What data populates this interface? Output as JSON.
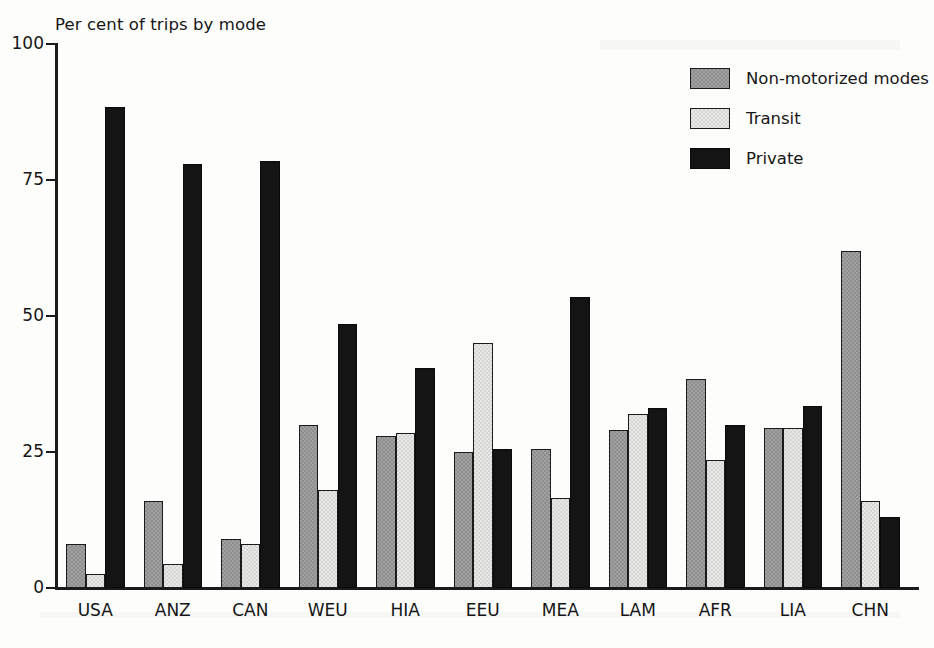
{
  "chart_data": {
    "type": "bar",
    "title": "Per cent of trips by mode",
    "xlabel": "",
    "ylabel": "",
    "ylim": [
      0,
      100
    ],
    "yticks": [
      0,
      25,
      50,
      75,
      100
    ],
    "grid": false,
    "legend_position": "top-right",
    "categories": [
      "USA",
      "ANZ",
      "CAN",
      "WEU",
      "HIA",
      "EEU",
      "MEA",
      "LAM",
      "AFR",
      "LIA",
      "CHN"
    ],
    "series": [
      {
        "name": "Non-motorized modes",
        "color": "#8e8e8e",
        "values": [
          8,
          16,
          9,
          30,
          28,
          25,
          25.5,
          29,
          38.5,
          29.5,
          62
        ]
      },
      {
        "name": "Transit",
        "color": "#d6d6d4",
        "values": [
          2.5,
          4.5,
          8,
          18,
          28.5,
          45,
          16.5,
          32,
          23.5,
          29.5,
          16
        ]
      },
      {
        "name": "Private",
        "color": "#141414",
        "values": [
          88.5,
          78,
          78.5,
          48.5,
          40.5,
          25.5,
          53.5,
          33,
          30,
          33.5,
          13
        ]
      }
    ]
  },
  "legend": {
    "items": [
      {
        "label": "Non-motorized modes",
        "swatch": "#8e8e8e"
      },
      {
        "label": "Transit",
        "swatch": "#d6d6d4"
      },
      {
        "label": "Private",
        "swatch": "#141414"
      }
    ]
  }
}
